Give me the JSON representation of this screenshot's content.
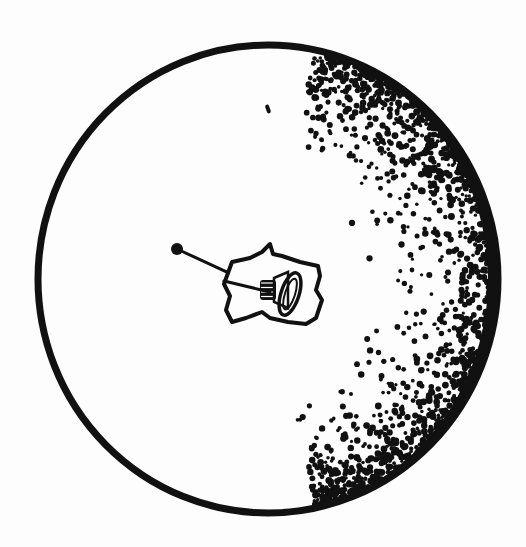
{
  "canvas": {
    "width": 526,
    "height": 547,
    "background": "#fdfdfd",
    "ink": "#111111"
  },
  "sphere": {
    "cx": 268,
    "cy": 279,
    "rx": 230,
    "ry": 234,
    "stroke_width": 7,
    "shading": {
      "side": "right",
      "seed": 7,
      "dot_count": 1400,
      "start_angle_deg": -78,
      "end_angle_deg": 78,
      "min_dot_r": 1.6,
      "max_dot_r": 3.6,
      "falloff_depth": 0.62,
      "rim_band_width": 10
    }
  },
  "stray_mark": {
    "x": 268,
    "y": 109,
    "w": 4,
    "h": 9
  },
  "object": {
    "pin": {
      "head_x": 177,
      "head_y": 249,
      "head_r": 6,
      "end_x": 270,
      "end_y": 292
    },
    "card_outline": "M232,262 L250,258 L262,252 L270,244 L273,254 L282,256 L300,262 L318,266 L320,276 L316,290 L322,300 L316,318 L306,324 L288,322 L270,318 L262,312 L246,318 L232,322 L226,310 L230,296 L224,284 Z",
    "coil": {
      "cx": 268,
      "cy": 290,
      "lines": 4
    },
    "bell": {
      "cx": 290,
      "cy": 294,
      "rx": 9,
      "ry": 22
    }
  }
}
